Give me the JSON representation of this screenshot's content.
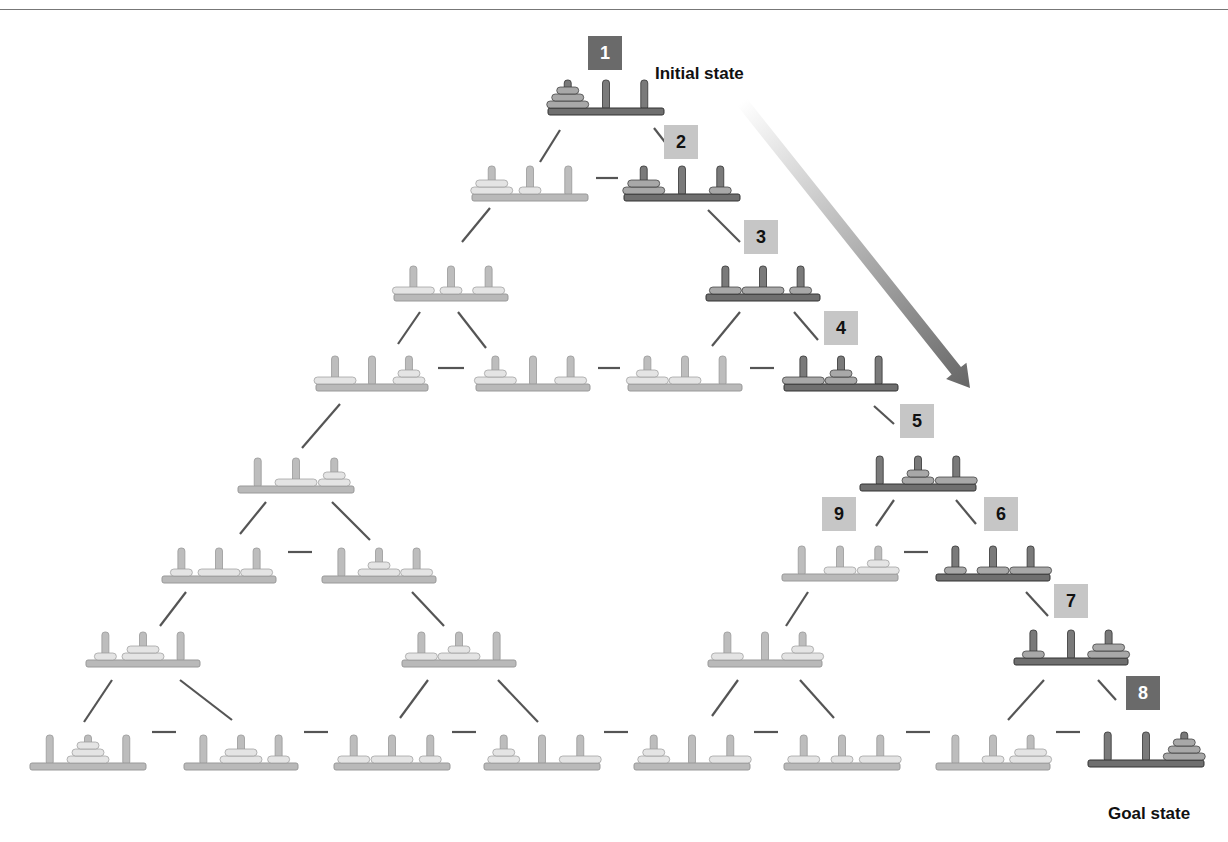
{
  "labels": {
    "initial": "Initial state",
    "goal": "Goal state"
  },
  "colors": {
    "dark_base": "#6f6f6f",
    "dark_peg": "#7a7a7a",
    "dark_disk": "#a8a8a8",
    "light_base": "#b9b9b9",
    "light_peg": "#bdbdbd",
    "light_disk": "#e4e4e4",
    "line": "#555555",
    "badge_light": "#c6c6c6",
    "badge_dark": "#6a6a6a"
  },
  "badges": [
    {
      "n": "1",
      "x": 588,
      "y": 36,
      "style": "dark"
    },
    {
      "n": "2",
      "x": 664,
      "y": 125,
      "style": "light"
    },
    {
      "n": "3",
      "x": 744,
      "y": 220,
      "style": "light"
    },
    {
      "n": "4",
      "x": 824,
      "y": 311,
      "style": "light"
    },
    {
      "n": "5",
      "x": 900,
      "y": 404,
      "style": "light"
    },
    {
      "n": "9",
      "x": 822,
      "y": 497,
      "style": "light"
    },
    {
      "n": "6",
      "x": 984,
      "y": 497,
      "style": "light"
    },
    {
      "n": "7",
      "x": 1054,
      "y": 584,
      "style": "light"
    },
    {
      "n": "8",
      "x": 1126,
      "y": 676,
      "style": "dark"
    }
  ],
  "states": [
    {
      "id": "s1",
      "x": 548,
      "y": 108,
      "w": 116,
      "hl": true,
      "pegs": [
        [
          3,
          2,
          1
        ],
        [],
        []
      ]
    },
    {
      "id": "s2L",
      "x": 472,
      "y": 194,
      "w": 116,
      "hl": false,
      "pegs": [
        [
          3,
          2
        ],
        [
          1
        ],
        []
      ]
    },
    {
      "id": "s2",
      "x": 624,
      "y": 194,
      "w": 116,
      "hl": true,
      "pegs": [
        [
          3,
          2
        ],
        [],
        [
          1
        ]
      ]
    },
    {
      "id": "s3L",
      "x": 394,
      "y": 294,
      "w": 114,
      "hl": false,
      "pegs": [
        [
          3
        ],
        [
          1
        ],
        [
          2
        ]
      ]
    },
    {
      "id": "s3",
      "x": 706,
      "y": 294,
      "w": 114,
      "hl": true,
      "pegs": [
        [
          2
        ],
        [
          3
        ],
        [
          1
        ]
      ]
    },
    {
      "id": "r4a",
      "x": 316,
      "y": 384,
      "w": 112,
      "hl": false,
      "pegs": [
        [
          3
        ],
        [],
        [
          2,
          1
        ]
      ]
    },
    {
      "id": "r4b",
      "x": 476,
      "y": 384,
      "w": 114,
      "hl": false,
      "pegs": [
        [
          3,
          1
        ],
        [],
        [
          2
        ]
      ]
    },
    {
      "id": "r4c",
      "x": 628,
      "y": 384,
      "w": 114,
      "hl": false,
      "pegs": [
        [
          3,
          1
        ],
        [
          2
        ],
        []
      ]
    },
    {
      "id": "s4",
      "x": 784,
      "y": 384,
      "w": 114,
      "hl": true,
      "pegs": [
        [
          3
        ],
        [
          2,
          1
        ],
        []
      ]
    },
    {
      "id": "l5",
      "x": 238,
      "y": 486,
      "w": 116,
      "hl": false,
      "pegs": [
        [],
        [
          3
        ],
        [
          2,
          1
        ]
      ]
    },
    {
      "id": "s5",
      "x": 860,
      "y": 484,
      "w": 116,
      "hl": true,
      "pegs": [
        [],
        [
          2,
          1
        ],
        [
          3
        ]
      ]
    },
    {
      "id": "l6a",
      "x": 162,
      "y": 576,
      "w": 114,
      "hl": false,
      "pegs": [
        [
          1
        ],
        [
          3
        ],
        [
          2
        ]
      ]
    },
    {
      "id": "l6b",
      "x": 322,
      "y": 576,
      "w": 114,
      "hl": false,
      "pegs": [
        [],
        [
          3,
          1
        ],
        [
          2
        ]
      ]
    },
    {
      "id": "s9",
      "x": 782,
      "y": 574,
      "w": 116,
      "hl": false,
      "pegs": [
        [],
        [
          2
        ],
        [
          3,
          1
        ]
      ]
    },
    {
      "id": "s6",
      "x": 936,
      "y": 574,
      "w": 114,
      "hl": true,
      "pegs": [
        [
          1
        ],
        [
          2
        ],
        [
          3
        ]
      ]
    },
    {
      "id": "l7a",
      "x": 86,
      "y": 660,
      "w": 114,
      "hl": false,
      "pegs": [
        [
          1
        ],
        [
          3,
          2
        ],
        []
      ]
    },
    {
      "id": "l7b",
      "x": 402,
      "y": 660,
      "w": 114,
      "hl": false,
      "pegs": [
        [
          2
        ],
        [
          3,
          1
        ],
        []
      ]
    },
    {
      "id": "r7a",
      "x": 708,
      "y": 660,
      "w": 114,
      "hl": false,
      "pegs": [
        [
          2
        ],
        [],
        [
          3,
          1
        ]
      ]
    },
    {
      "id": "s7",
      "x": 1014,
      "y": 658,
      "w": 114,
      "hl": true,
      "pegs": [
        [
          1
        ],
        [],
        [
          3,
          2
        ]
      ]
    },
    {
      "id": "b1",
      "x": 30,
      "y": 763,
      "w": 116,
      "hl": false,
      "pegs": [
        [],
        [
          3,
          2,
          1
        ],
        []
      ]
    },
    {
      "id": "b2",
      "x": 184,
      "y": 763,
      "w": 114,
      "hl": false,
      "pegs": [
        [],
        [
          3,
          2
        ],
        [
          1
        ]
      ]
    },
    {
      "id": "b3",
      "x": 334,
      "y": 763,
      "w": 116,
      "hl": false,
      "pegs": [
        [
          2
        ],
        [
          3
        ],
        [
          1
        ]
      ]
    },
    {
      "id": "b4",
      "x": 484,
      "y": 763,
      "w": 116,
      "hl": false,
      "pegs": [
        [
          2,
          1
        ],
        [],
        [
          3
        ]
      ]
    },
    {
      "id": "b5",
      "x": 634,
      "y": 763,
      "w": 116,
      "hl": false,
      "pegs": [
        [
          2,
          1
        ],
        [],
        [
          3
        ]
      ]
    },
    {
      "id": "b6",
      "x": 784,
      "y": 763,
      "w": 116,
      "hl": false,
      "pegs": [
        [
          2
        ],
        [
          1
        ],
        [
          3
        ]
      ]
    },
    {
      "id": "b7",
      "x": 936,
      "y": 763,
      "w": 114,
      "hl": false,
      "pegs": [
        [],
        [
          1
        ],
        [
          3,
          2
        ]
      ]
    },
    {
      "id": "s8",
      "x": 1088,
      "y": 760,
      "w": 116,
      "hl": true,
      "pegs": [
        [],
        [],
        [
          3,
          2,
          1
        ]
      ]
    }
  ],
  "edges": [
    [
      560,
      130,
      540,
      162
    ],
    [
      654,
      128,
      668,
      146
    ],
    [
      596,
      178,
      618,
      178
    ],
    [
      490,
      208,
      462,
      242
    ],
    [
      708,
      210,
      740,
      242
    ],
    [
      420,
      312,
      398,
      344
    ],
    [
      458,
      312,
      486,
      348
    ],
    [
      740,
      312,
      712,
      346
    ],
    [
      794,
      312,
      818,
      340
    ],
    [
      438,
      368,
      464,
      368
    ],
    [
      598,
      368,
      620,
      368
    ],
    [
      750,
      368,
      774,
      368
    ],
    [
      340,
      404,
      302,
      448
    ],
    [
      874,
      406,
      894,
      424
    ],
    [
      266,
      502,
      240,
      534
    ],
    [
      332,
      502,
      370,
      540
    ],
    [
      894,
      500,
      876,
      526
    ],
    [
      956,
      500,
      976,
      524
    ],
    [
      288,
      552,
      312,
      552
    ],
    [
      904,
      552,
      928,
      552
    ],
    [
      186,
      592,
      160,
      626
    ],
    [
      412,
      592,
      444,
      626
    ],
    [
      808,
      592,
      786,
      626
    ],
    [
      1026,
      592,
      1048,
      616
    ],
    [
      112,
      680,
      84,
      722
    ],
    [
      180,
      680,
      232,
      720
    ],
    [
      428,
      680,
      400,
      718
    ],
    [
      498,
      680,
      538,
      722
    ],
    [
      738,
      680,
      712,
      716
    ],
    [
      800,
      680,
      834,
      718
    ],
    [
      1044,
      680,
      1008,
      720
    ],
    [
      1098,
      680,
      1116,
      700
    ],
    [
      152,
      732,
      176,
      732
    ],
    [
      304,
      732,
      328,
      732
    ],
    [
      452,
      732,
      476,
      732
    ],
    [
      604,
      732,
      628,
      732
    ],
    [
      754,
      732,
      778,
      732
    ],
    [
      906,
      732,
      930,
      732
    ],
    [
      1056,
      732,
      1080,
      732
    ]
  ],
  "arrow": {
    "x1": 742,
    "y1": 102,
    "x2": 970,
    "y2": 388
  }
}
